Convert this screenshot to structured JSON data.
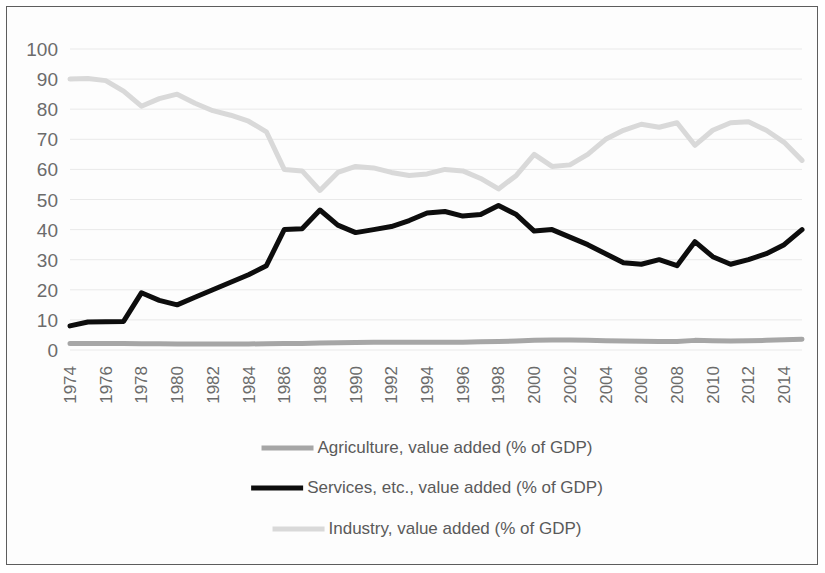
{
  "chart_data": {
    "type": "line",
    "title": "",
    "xlabel": "",
    "ylabel": "",
    "ylim": [
      0,
      100
    ],
    "ytick_step": 10,
    "grid": true,
    "legend_position": "bottom",
    "y_ticks": [
      "0",
      "10",
      "20",
      "30",
      "40",
      "50",
      "60",
      "70",
      "80",
      "90",
      "100"
    ],
    "x": [
      1974,
      1975,
      1976,
      1977,
      1978,
      1979,
      1980,
      1981,
      1982,
      1983,
      1984,
      1985,
      1986,
      1987,
      1988,
      1989,
      1990,
      1991,
      1992,
      1993,
      1994,
      1995,
      1996,
      1997,
      1998,
      1999,
      2000,
      2001,
      2002,
      2003,
      2004,
      2005,
      2006,
      2007,
      2008,
      2009,
      2010,
      2011,
      2012,
      2013,
      2014,
      2015
    ],
    "x_tick_labels": [
      "1974",
      "1976",
      "1978",
      "1980",
      "1982",
      "1984",
      "1986",
      "1988",
      "1990",
      "1992",
      "1994",
      "1996",
      "1998",
      "2000",
      "2002",
      "2004",
      "2006",
      "2008",
      "2010",
      "2012",
      "2014"
    ],
    "series": [
      {
        "name": "Agriculture, value added (% of GDP)",
        "color": "#a6a6a6",
        "width": 5,
        "values": [
          2.2,
          2.2,
          2.2,
          2.2,
          2.1,
          2.1,
          2.0,
          2.0,
          2.0,
          2.0,
          2.0,
          2.1,
          2.2,
          2.2,
          2.3,
          2.4,
          2.5,
          2.6,
          2.6,
          2.6,
          2.6,
          2.6,
          2.6,
          2.7,
          2.8,
          3.0,
          3.2,
          3.3,
          3.3,
          3.2,
          3.1,
          3.0,
          2.9,
          2.8,
          2.8,
          3.2,
          3.1,
          3.0,
          3.1,
          3.2,
          3.4,
          3.6
        ]
      },
      {
        "name": "Services, etc., value added (% of GDP)",
        "color": "#0d0d0d",
        "width": 5,
        "values": [
          8.0,
          9.3,
          9.4,
          9.5,
          19.0,
          16.5,
          15.0,
          17.5,
          20.0,
          22.5,
          25.0,
          28.0,
          40.0,
          40.3,
          46.5,
          41.5,
          39.0,
          40.0,
          41.0,
          43.0,
          45.5,
          46.0,
          44.5,
          45.0,
          48.0,
          45.0,
          39.5,
          40.0,
          37.5,
          35.0,
          32.0,
          29.0,
          28.5,
          30.0,
          28.0,
          36.0,
          31.0,
          28.5,
          30.0,
          32.0,
          35.0,
          40.0
        ]
      },
      {
        "name": "Industry, value added (% of GDP)",
        "color": "#d9d9d9",
        "width": 5,
        "values": [
          90.0,
          90.2,
          89.5,
          86.0,
          81.0,
          83.5,
          85.0,
          82.0,
          79.5,
          78.0,
          76.0,
          72.5,
          60.0,
          59.5,
          53.0,
          59.0,
          61.0,
          60.5,
          59.0,
          58.0,
          58.5,
          60.0,
          59.5,
          57.0,
          53.5,
          58.0,
          65.0,
          61.0,
          61.5,
          65.0,
          70.0,
          73.0,
          75.0,
          74.0,
          75.5,
          68.0,
          73.0,
          75.5,
          75.8,
          73.0,
          69.0,
          63.0
        ]
      }
    ]
  },
  "legend": {
    "items": [
      {
        "label": "Agriculture, value added (% of GDP)",
        "color": "#a6a6a6"
      },
      {
        "label": "Services, etc., value added (% of GDP)",
        "color": "#0d0d0d"
      },
      {
        "label": "Industry, value added (% of GDP)",
        "color": "#d9d9d9"
      }
    ]
  }
}
